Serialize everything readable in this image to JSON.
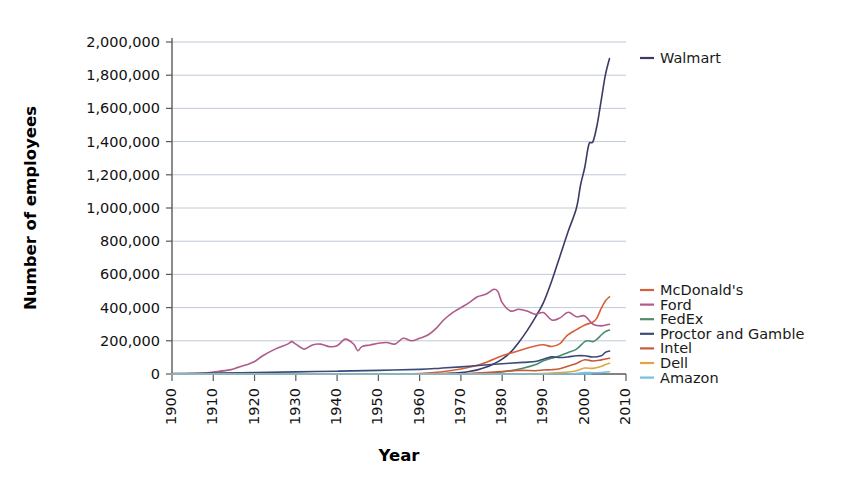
{
  "chart_data": {
    "type": "line",
    "title": "",
    "xlabel": "Year",
    "ylabel": "Number of employees",
    "xlim": [
      1900,
      2010
    ],
    "ylim": [
      0,
      2000000
    ],
    "grid": true,
    "legend_position": "right",
    "xticks": [
      1900,
      1910,
      1920,
      1930,
      1940,
      1950,
      1960,
      1970,
      1980,
      1990,
      2000,
      2010
    ],
    "xtick_labels": [
      "1900",
      "1910",
      "1920",
      "1930",
      "1940",
      "1950",
      "1960",
      "1970",
      "1980",
      "1990",
      "2000",
      "2010"
    ],
    "yticks": [
      0,
      200000,
      400000,
      600000,
      800000,
      1000000,
      1200000,
      1400000,
      1600000,
      1800000,
      2000000
    ],
    "ytick_labels": [
      "0",
      "200,000",
      "400,000",
      "600,000",
      "800,000",
      "1,000,000",
      "1,200,000",
      "1,400,000",
      "1,600,000",
      "1,800,000",
      "2,000,000"
    ],
    "series": [
      {
        "name": "Walmart",
        "color": "#3b3b66",
        "label_position": "top-right",
        "x": [
          1900,
          1950,
          1960,
          1962,
          1965,
          1968,
          1970,
          1972,
          1974,
          1976,
          1978,
          1980,
          1982,
          1984,
          1986,
          1988,
          1990,
          1992,
          1994,
          1996,
          1998,
          1999,
          2000,
          2001,
          2002,
          2003,
          2004,
          2005,
          2006
        ],
        "values": [
          0,
          0,
          0,
          500,
          2000,
          5000,
          8000,
          15000,
          25000,
          40000,
          62000,
          90000,
          130000,
          190000,
          260000,
          340000,
          430000,
          560000,
          710000,
          860000,
          1000000,
          1140000,
          1244000,
          1383000,
          1400000,
          1500000,
          1650000,
          1800000,
          1900000
        ]
      },
      {
        "name": "McDonald's",
        "color": "#d95f3b",
        "x": [
          1900,
          1950,
          1955,
          1960,
          1965,
          1970,
          1975,
          1980,
          1982,
          1985,
          1988,
          1990,
          1992,
          1994,
          1995,
          1996,
          1998,
          2000,
          2002,
          2003,
          2004,
          2005,
          2006
        ],
        "values": [
          0,
          0,
          500,
          3000,
          12000,
          30000,
          60000,
          110000,
          125000,
          148000,
          169000,
          176000,
          166000,
          183000,
          212000,
          237000,
          267000,
          295000,
          313000,
          340000,
          395000,
          440000,
          465000
        ]
      },
      {
        "name": "Ford",
        "color": "#b05a8a",
        "x": [
          1900,
          1903,
          1908,
          1910,
          1914,
          1916,
          1918,
          1920,
          1922,
          1925,
          1928,
          1929,
          1930,
          1932,
          1934,
          1936,
          1938,
          1940,
          1942,
          1944,
          1945,
          1946,
          1948,
          1950,
          1952,
          1954,
          1956,
          1958,
          1960,
          1962,
          1964,
          1966,
          1968,
          1970,
          1972,
          1974,
          1976,
          1978,
          1979,
          1980,
          1982,
          1984,
          1986,
          1988,
          1990,
          1992,
          1994,
          1996,
          1998,
          2000,
          2002,
          2004,
          2006
        ],
        "values": [
          0,
          1000,
          6000,
          12000,
          25000,
          40000,
          55000,
          75000,
          110000,
          150000,
          180000,
          195000,
          180000,
          150000,
          175000,
          180000,
          165000,
          170000,
          210000,
          180000,
          140000,
          165000,
          175000,
          185000,
          190000,
          180000,
          215000,
          200000,
          215000,
          235000,
          275000,
          330000,
          370000,
          400000,
          430000,
          465000,
          480000,
          510000,
          495000,
          430000,
          380000,
          390000,
          380000,
          360000,
          370000,
          325000,
          338000,
          372000,
          345000,
          350000,
          300000,
          290000,
          300000
        ]
      },
      {
        "name": "FedEx",
        "color": "#4b8c6f",
        "x": [
          1900,
          1971,
          1975,
          1980,
          1985,
          1988,
          1990,
          1992,
          1994,
          1996,
          1998,
          2000,
          2001,
          2002,
          2003,
          2004,
          2005,
          2006
        ],
        "values": [
          0,
          400,
          3000,
          12000,
          35000,
          55000,
          80000,
          95000,
          110000,
          130000,
          150000,
          195000,
          200000,
          195000,
          210000,
          235000,
          255000,
          265000
        ]
      },
      {
        "name": "Proctor and Gamble",
        "color": "#3b4a7a",
        "x": [
          1900,
          1910,
          1920,
          1930,
          1940,
          1950,
          1960,
          1965,
          1970,
          1975,
          1980,
          1985,
          1988,
          1990,
          1992,
          1994,
          1996,
          1998,
          2000,
          2002,
          2004,
          2005,
          2006
        ],
        "values": [
          3000,
          5000,
          9000,
          13000,
          17000,
          22000,
          28000,
          35000,
          43000,
          53000,
          62000,
          70000,
          75000,
          89000,
          103000,
          99000,
          103000,
          110000,
          110000,
          102000,
          110000,
          130000,
          138000
        ]
      },
      {
        "name": "Intel",
        "color": "#c85a3a",
        "x": [
          1900,
          1968,
          1972,
          1976,
          1980,
          1984,
          1988,
          1990,
          1992,
          1994,
          1996,
          1998,
          2000,
          2002,
          2004,
          2006
        ],
        "values": [
          0,
          200,
          2500,
          8000,
          15000,
          22000,
          20000,
          24000,
          26000,
          32000,
          48000,
          64000,
          86000,
          78000,
          85000,
          95000
        ]
      },
      {
        "name": "Dell",
        "color": "#e0a53f",
        "x": [
          1900,
          1984,
          1988,
          1990,
          1992,
          1994,
          1996,
          1998,
          2000,
          2002,
          2004,
          2005,
          2006
        ],
        "values": [
          0,
          100,
          1500,
          3000,
          5000,
          8000,
          12000,
          20000,
          36000,
          34000,
          46000,
          57000,
          65000
        ]
      },
      {
        "name": "Amazon",
        "color": "#78bee0",
        "x": [
          1900,
          1994,
          1996,
          1998,
          2000,
          2002,
          2004,
          2005,
          2006
        ],
        "values": [
          0,
          10,
          600,
          2100,
          9000,
          7500,
          9000,
          12000,
          13900
        ]
      }
    ]
  },
  "legend": {
    "items": [
      {
        "label": "McDonald's",
        "color": "#d95f3b"
      },
      {
        "label": "Ford",
        "color": "#b05a8a"
      },
      {
        "label": "FedEx",
        "color": "#4b8c6f"
      },
      {
        "label": "Proctor and Gamble",
        "color": "#3b4a7a"
      },
      {
        "label": "Intel",
        "color": "#c85a3a"
      },
      {
        "label": "Dell",
        "color": "#e0a53f"
      },
      {
        "label": "Amazon",
        "color": "#78bee0"
      }
    ],
    "callout": {
      "label": "Walmart",
      "color": "#3b3b66"
    }
  }
}
